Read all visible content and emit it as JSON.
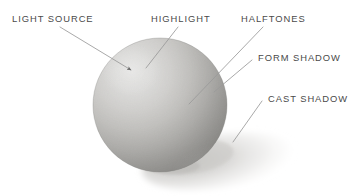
{
  "diagram": {
    "background_color": "#ffffff",
    "label_color": "#4a4a4a",
    "leader_line_color": "#9a9a9a",
    "light_direction": "upper-left",
    "labels": [
      {
        "id": "light-source",
        "text": "LIGHT SOURCE",
        "x": 12,
        "y": 14
      },
      {
        "id": "highlight",
        "text": "HIGHLIGHT",
        "x": 151,
        "y": 14
      },
      {
        "id": "halftones",
        "text": "HALFTONES",
        "x": 241,
        "y": 14
      },
      {
        "id": "form-shadow",
        "text": "FORM SHADOW",
        "x": 258,
        "y": 53
      },
      {
        "id": "cast-shadow",
        "text": "CAST SHADOW",
        "x": 268,
        "y": 94
      }
    ],
    "leaders": [
      {
        "id": "leader-light-source",
        "x1": 60,
        "y1": 27,
        "x2": 131,
        "y2": 70,
        "arrow": true
      },
      {
        "id": "leader-highlight",
        "x1": 178,
        "y1": 27,
        "x2": 146,
        "y2": 68,
        "arrow": false
      },
      {
        "id": "leader-halftones",
        "x1": 263,
        "y1": 27,
        "x2": 189,
        "y2": 104,
        "arrow": false
      },
      {
        "id": "leader-form-shadow",
        "x1": 252,
        "y1": 60,
        "x2": 214,
        "y2": 92,
        "arrow": false
      },
      {
        "id": "leader-cast-shadow",
        "x1": 262,
        "y1": 101,
        "x2": 233,
        "y2": 142,
        "arrow": false
      }
    ],
    "sphere": {
      "center_x": 160,
      "center_y": 105,
      "radius": 67,
      "highlight_x": 131,
      "highlight_y": 70,
      "highlight_color": "#f2f2f1",
      "midtone_color": "#bdbcb9",
      "core_shadow_color": "#6d6c69",
      "reflected_light_color": "#a4a3a0",
      "edge_color": "#888784"
    },
    "cast_shadow": {
      "center_x": 219,
      "center_y": 161,
      "radius_x": 78,
      "radius_y": 27,
      "rotation_deg": -8,
      "color": "#d6d5d3"
    }
  }
}
